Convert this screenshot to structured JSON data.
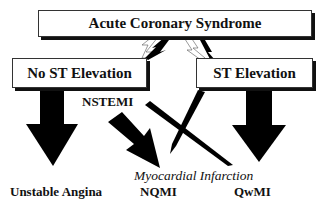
{
  "diagram": {
    "title_box": "Acute Coronary Syndrome",
    "left_box": "No ST Elevation",
    "right_box": "ST Elevation",
    "nstemi_label": "NSTEMI",
    "mi_label": "Myocardial Infarction",
    "outcomes": [
      "Unstable Angina",
      "NQMI",
      "QwMI"
    ]
  }
}
